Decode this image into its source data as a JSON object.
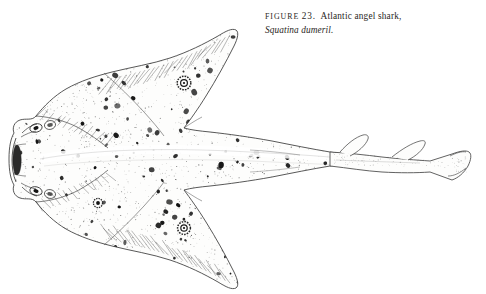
{
  "page": {
    "background_color": "#ffffff",
    "width": 486,
    "height": 294,
    "kind": "book-plate"
  },
  "caption": {
    "figure_label": "FIGURE",
    "figure_number": "23.",
    "common_name": "Atlantic angel shark,",
    "scientific_name": "Squatina dumeril.",
    "line1": "FIGURE 23.  Atlantic angel shark,",
    "line2": "Squatina dumeril.",
    "text_color": "#2a2724"
  },
  "illustration": {
    "title": "Atlantic angel shark dorsal view",
    "technique": "pen-and-ink stipple engraving",
    "ink_color": "#1b1b1b",
    "outline_color": "#3a3a3a",
    "stipple_color": "#2e2e2e",
    "fill_color": "#fdfdfc",
    "parts": [
      {
        "name": "head",
        "label": "head with terminal mouth and nasal barbels"
      },
      {
        "name": "eye-left",
        "label": "eye"
      },
      {
        "name": "spiracle",
        "label": "spiracle"
      },
      {
        "name": "pectoral-fin-upper",
        "label": "upper pectoral fin"
      },
      {
        "name": "pectoral-fin-lower",
        "label": "lower pectoral fin"
      },
      {
        "name": "pelvic-fin-upper",
        "label": "upper pelvic fin"
      },
      {
        "name": "pelvic-fin-lower",
        "label": "lower pelvic fin"
      },
      {
        "name": "ocellus-upper",
        "label": "upper ocellus eyespot"
      },
      {
        "name": "ocellus-lower",
        "label": "lower ocellus eyespot"
      },
      {
        "name": "body-trunk",
        "label": "flattened trunk with dorsal ridge"
      },
      {
        "name": "tail",
        "label": "tail stalk"
      },
      {
        "name": "dorsal-fin-first",
        "label": "first dorsal fin"
      },
      {
        "name": "dorsal-fin-second",
        "label": "second dorsal fin"
      },
      {
        "name": "caudal-fin",
        "label": "caudal fin"
      }
    ]
  },
  "stipple": {
    "seed": 20231,
    "body_dots": 2400,
    "spot_count": 210,
    "spot_color": "#111111"
  }
}
